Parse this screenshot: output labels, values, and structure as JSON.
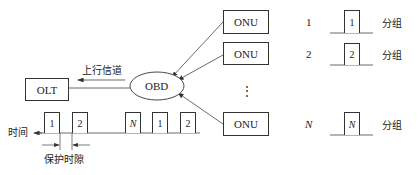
{
  "diagram": {
    "type": "TDMA upstream PON diagram",
    "olt": {
      "label": "OLT"
    },
    "obd": {
      "label": "OBD"
    },
    "upstream_label": "上行信道",
    "onus": [
      {
        "label": "ONU",
        "index": "1",
        "packet": "1",
        "packet_label": "分组"
      },
      {
        "label": "ONU",
        "index": "2",
        "packet": "2",
        "packet_label": "分组"
      },
      {
        "label": "ONU",
        "index": "N",
        "packet": "N",
        "packet_label": "分组"
      }
    ],
    "ellipsis": "⋮",
    "timeline": {
      "axis_label": "时间",
      "packets": [
        "1",
        "2",
        "N",
        "1",
        "2"
      ],
      "guard_label": "保护时隙"
    }
  }
}
